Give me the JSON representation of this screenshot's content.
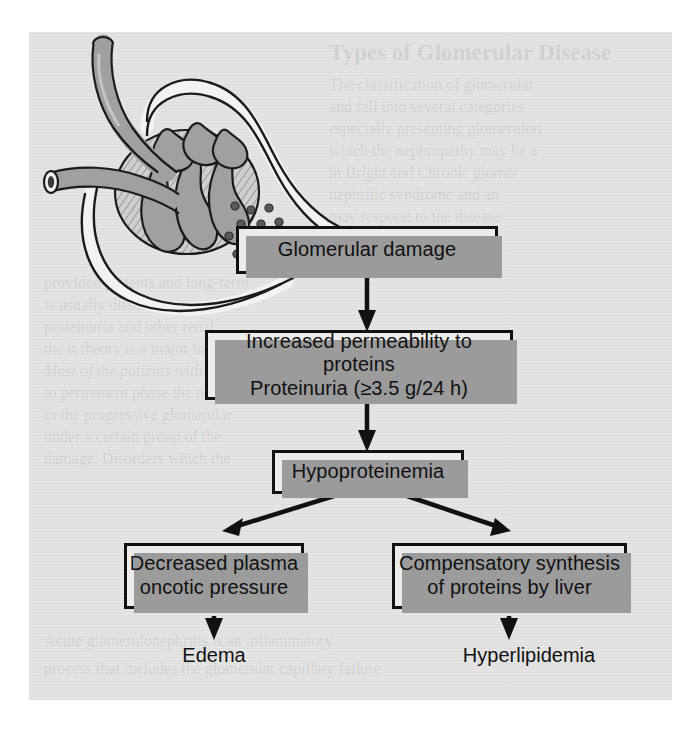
{
  "figure": {
    "type": "flowchart",
    "panel_background": "#e3e3e3",
    "box_fill": "#ececec",
    "box_border": "#111111",
    "shadow_color": "#9b9b9b",
    "ink_color": "#111111",
    "illustration_name": "glomerulus-with-protein-leak"
  },
  "boxes": [
    {
      "id": "glomerular-damage",
      "lines": [
        "Glomerular damage"
      ],
      "line1": "Glomerular damage"
    },
    {
      "id": "increased-permeability",
      "lines": [
        "Increased permeability to proteins",
        "Proteinuria (≥3.5 g/24 h)"
      ],
      "line1": "Increased permeability to proteins",
      "line2": "Proteinuria (≥3.5 g/24 h)"
    },
    {
      "id": "hypoproteinemia",
      "lines": [
        "Hypoproteinemia"
      ],
      "line1": "Hypoproteinemia"
    },
    {
      "id": "decreased-oncotic-pressure",
      "lines": [
        "Decreased plasma",
        "oncotic pressure"
      ],
      "line1": "Decreased plasma",
      "line2": "oncotic pressure"
    },
    {
      "id": "compensatory-synthesis",
      "lines": [
        "Compensatory synthesis",
        "of proteins by liver"
      ],
      "line1": "Compensatory synthesis",
      "line2": "of proteins by liver"
    }
  ],
  "terminal_labels": {
    "edema": "Edema",
    "hyperlipidemia": "Hyperlipidemia"
  },
  "flow_edges": [
    {
      "from": "glomerular-damage",
      "to": "increased-permeability",
      "direction": "down"
    },
    {
      "from": "increased-permeability",
      "to": "hypoproteinemia",
      "direction": "down"
    },
    {
      "from": "hypoproteinemia",
      "to": "decreased-oncotic-pressure",
      "direction": "down-left"
    },
    {
      "from": "hypoproteinemia",
      "to": "compensatory-synthesis",
      "direction": "down-right"
    },
    {
      "from": "decreased-oncotic-pressure",
      "to": "edema",
      "direction": "down"
    },
    {
      "from": "compensatory-synthesis",
      "to": "hyperlipidemia",
      "direction": "down"
    }
  ],
  "illustration": {
    "name": "glomerulus-with-protein-leak",
    "parts": [
      "afferent-arteriole",
      "efferent-arteriole",
      "capillary-tuft",
      "bowmans-capsule",
      "proximal-tubule",
      "protein-particles"
    ],
    "protein_particle_count": 13
  },
  "showthrough_text": {
    "heading": "Types of Glomerular Disease",
    "lines": [
      "The classification of glomerular",
      "and fall into several categories",
      "especially presenting glomerulon",
      "which the nephropathy may be a",
      "in Bright and Chronic glomer",
      "nephritic syndrome and an",
      "may respond to the disease",
      "provided patients and long-term",
      "is usually dissolves or resolves",
      "proteinuria and other renal",
      "the it theory is a major in",
      "Most of the patients with",
      "to permanent phase the not recognized",
      "in the progressive glomerular",
      "under a certain group of the",
      "damage. Disorders which the",
      "Acute glomerulonephritis is an inflammatory",
      "process that includes the glomerular capillary failure"
    ]
  }
}
